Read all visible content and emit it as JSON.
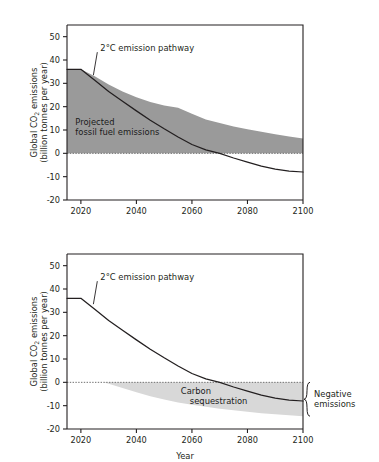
{
  "figure": {
    "background_color": "#ffffff",
    "text_color": "#231f20",
    "band_fill_dark": "#9a9a9a",
    "band_fill_light": "#d8d8d8",
    "line_color": "#231f20"
  },
  "chart_data": [
    {
      "id": "top",
      "type": "area",
      "title": "",
      "xlabel": "",
      "ylabel": "Global CO₂ emissions\n(billion tonnes per year)",
      "ylabel_line1": "Global CO",
      "ylabel_sub": "2",
      "ylabel_line1_tail": " emissions",
      "ylabel_line2": "(billion tonnes per year)",
      "xlim": [
        2015,
        2100
      ],
      "ylim": [
        -20,
        55
      ],
      "xticks": [
        2020,
        2040,
        2060,
        2080,
        2100
      ],
      "xticklabels": [
        "2020",
        "2040",
        "2060",
        "2080",
        "2100"
      ],
      "yticks": [
        -20,
        -10,
        0,
        10,
        20,
        30,
        40,
        50
      ],
      "yticklabels": [
        "-20",
        "-10",
        "0",
        "10",
        "20",
        "30",
        "40",
        "50"
      ],
      "grid": false,
      "legend_position": "none",
      "zero_line": 0,
      "annotations": [
        {
          "name": "pathway-label",
          "text": "2°C emission pathway",
          "x": 2027,
          "y": 44,
          "leader_to": [
            2024.5,
            33.5
          ]
        },
        {
          "name": "projected-fossil-label",
          "line1": "Projected",
          "line2": "fossil fuel emissions",
          "x": 2018,
          "y": 12
        }
      ],
      "series": [
        {
          "name": "2°C emission pathway",
          "style": "line",
          "x": [
            2015,
            2020,
            2025,
            2030,
            2035,
            2040,
            2045,
            2050,
            2055,
            2060,
            2065,
            2070,
            2075,
            2080,
            2085,
            2090,
            2095,
            2100
          ],
          "values": [
            36.0,
            36.0,
            31.3,
            26.5,
            22.3,
            18.2,
            14.2,
            10.5,
            7.0,
            3.8,
            1.5,
            0.0,
            -2.0,
            -3.8,
            -5.5,
            -6.8,
            -7.6,
            -8.0
          ]
        },
        {
          "name": "Projected fossil fuel emissions",
          "style": "band",
          "x": [
            2015,
            2020,
            2025,
            2030,
            2035,
            2040,
            2045,
            2050,
            2055,
            2060,
            2065,
            2070,
            2075,
            2080,
            2085,
            2090,
            2095,
            2100
          ],
          "upper": [
            36.0,
            36.0,
            33.0,
            29.5,
            26.5,
            24.0,
            22.0,
            20.5,
            19.5,
            17.0,
            14.5,
            13.0,
            11.5,
            10.3,
            9.2,
            8.2,
            7.2,
            6.4
          ],
          "lower": [
            0.0,
            0.0,
            0.0,
            0.0,
            0.0,
            0.0,
            0.0,
            0.0,
            0.0,
            0.0,
            0.0,
            0.0,
            0.0,
            0.0,
            0.0,
            0.0,
            0.0,
            0.0
          ],
          "fill_color": "#9a9a9a"
        }
      ]
    },
    {
      "id": "bottom",
      "type": "area",
      "title": "",
      "xlabel": "Year",
      "ylabel_line1": "Global CO",
      "ylabel_sub": "2",
      "ylabel_line1_tail": " emissions",
      "ylabel_line2": "(billion tonnes per year)",
      "xlim": [
        2015,
        2100
      ],
      "ylim": [
        -20,
        55
      ],
      "xticks": [
        2020,
        2040,
        2060,
        2080,
        2100
      ],
      "xticklabels": [
        "2020",
        "2040",
        "2060",
        "2080",
        "2100"
      ],
      "yticks": [
        -20,
        -10,
        0,
        10,
        20,
        30,
        40,
        50
      ],
      "yticklabels": [
        "-20",
        "-10",
        "0",
        "10",
        "20",
        "30",
        "40",
        "50"
      ],
      "grid": false,
      "legend_position": "none",
      "zero_line": 0,
      "annotations": [
        {
          "name": "pathway-label",
          "text": "2°C emission pathway",
          "x": 2027,
          "y": 44,
          "leader_to": [
            2024.5,
            33.5
          ]
        },
        {
          "name": "carbon-sequestration-label",
          "line1": "Carbon",
          "line2": "sequestration",
          "x": 2056,
          "y": -5
        },
        {
          "name": "negative-emissions-label",
          "line1": "Negative",
          "line2": "emissions",
          "bracket_from": 0,
          "bracket_to": -14.5,
          "at_year": 2100
        }
      ],
      "series": [
        {
          "name": "2°C emission pathway",
          "style": "line",
          "x": [
            2015,
            2020,
            2025,
            2030,
            2035,
            2040,
            2045,
            2050,
            2055,
            2060,
            2065,
            2070,
            2075,
            2080,
            2085,
            2090,
            2095,
            2100
          ],
          "values": [
            36.0,
            36.0,
            31.3,
            26.5,
            22.3,
            18.2,
            14.2,
            10.5,
            7.0,
            3.8,
            1.5,
            0.0,
            -2.0,
            -3.8,
            -5.5,
            -6.8,
            -7.6,
            -8.0
          ]
        },
        {
          "name": "Carbon sequestration",
          "style": "band",
          "x": [
            2028,
            2030,
            2035,
            2040,
            2045,
            2050,
            2055,
            2060,
            2065,
            2070,
            2075,
            2080,
            2085,
            2090,
            2095,
            2100
          ],
          "upper": [
            0.0,
            0.0,
            0.0,
            0.0,
            0.0,
            0.0,
            0.0,
            0.0,
            0.0,
            0.0,
            0.0,
            0.0,
            0.0,
            0.0,
            0.0,
            0.0
          ],
          "lower": [
            0.0,
            -0.6,
            -2.4,
            -4.3,
            -6.0,
            -7.4,
            -8.6,
            -9.6,
            -10.5,
            -11.3,
            -12.0,
            -12.6,
            -13.2,
            -13.7,
            -14.1,
            -14.5
          ],
          "fill_color": "#d8d8d8"
        }
      ]
    }
  ]
}
